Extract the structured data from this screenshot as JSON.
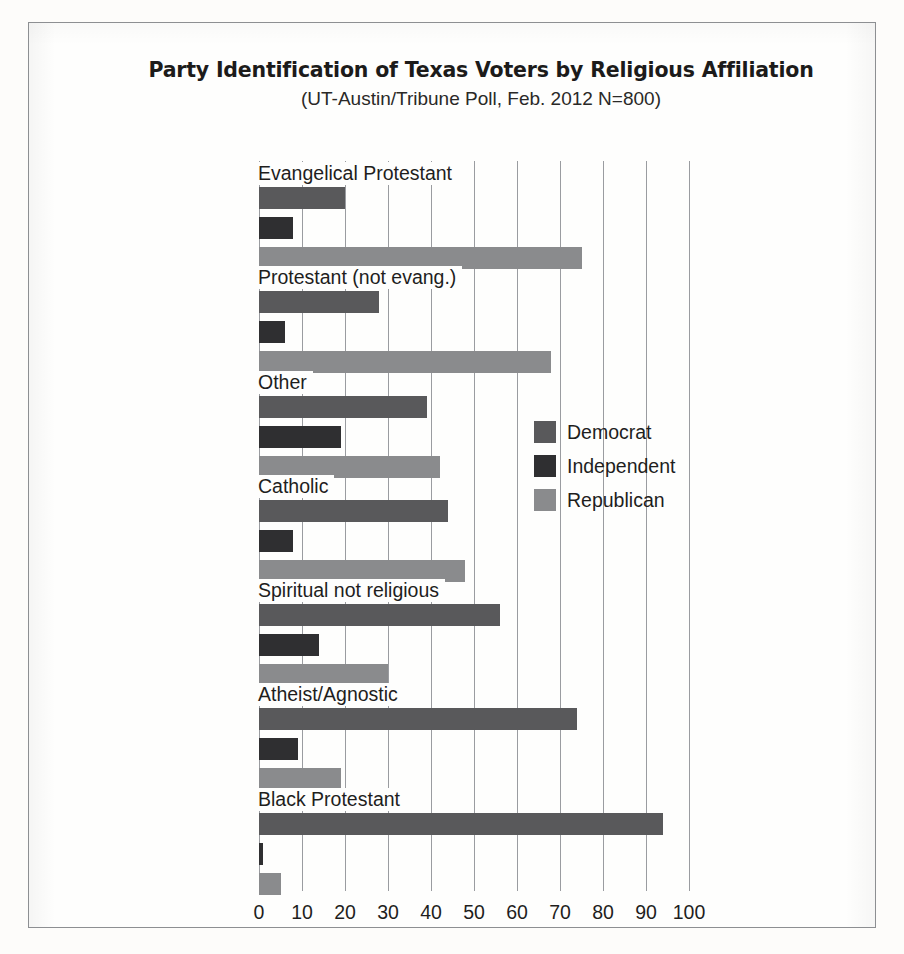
{
  "figure": {
    "title": "Party Identification of Texas Voters by Religious Affiliation",
    "subtitle": "(UT-Austin/Tribune Poll, Feb. 2012 N=800)"
  },
  "legend": {
    "items": [
      {
        "label": "Democrat",
        "key": "dem",
        "color": "#59595b"
      },
      {
        "label": "Independent",
        "key": "ind",
        "color": "#2f2f31"
      },
      {
        "label": "Republican",
        "key": "rep",
        "color": "#8a8b8d"
      }
    ]
  },
  "chart_data": {
    "type": "bar",
    "orientation": "horizontal",
    "title": "Party Identification of Texas Voters by Religious Affiliation",
    "subtitle": "(UT-Austin/Tribune Poll, Feb. 2012 N=800)",
    "xlabel": "",
    "ylabel": "",
    "xlim": [
      0,
      100
    ],
    "xticks": [
      0,
      10,
      20,
      30,
      40,
      50,
      60,
      70,
      80,
      90,
      100
    ],
    "grid": "vertical",
    "legend_position": "inside-right",
    "categories": [
      "Evangelical Protestant",
      "Protestant (not evang.)",
      "Other",
      "Catholic",
      "Spiritual not religious",
      "Atheist/Agnostic",
      "Black Protestant"
    ],
    "series": [
      {
        "name": "Democrat",
        "color": "#59595b",
        "values": [
          20,
          28,
          39,
          44,
          56,
          74,
          94
        ]
      },
      {
        "name": "Independent",
        "color": "#2f2f31",
        "values": [
          8,
          6,
          19,
          8,
          14,
          9,
          1
        ]
      },
      {
        "name": "Republican",
        "color": "#8a8b8d",
        "values": [
          75,
          68,
          42,
          48,
          30,
          19,
          5
        ]
      }
    ]
  }
}
